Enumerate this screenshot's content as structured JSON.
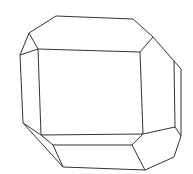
{
  "figure": {
    "background": "#ffffff",
    "stroke": "#333333",
    "vertices": {
      "A": [
        56,
        16
      ],
      "B": [
        133,
        19
      ],
      "C": [
        153,
        37
      ],
      "D": [
        174,
        61
      ],
      "E": [
        181,
        69
      ],
      "F": [
        181,
        136
      ],
      "G": [
        174,
        157
      ],
      "H": [
        145,
        170
      ],
      "I": [
        63,
        167
      ],
      "J": [
        23,
        123
      ],
      "K": [
        20,
        55
      ],
      "L": [
        29,
        33
      ],
      "P": [
        38,
        49
      ],
      "Q": [
        140,
        52
      ],
      "R": [
        143,
        134
      ],
      "S": [
        41,
        135
      ],
      "T": [
        132,
        145
      ],
      "U": [
        53,
        145
      ],
      "V": [
        175,
        127
      ]
    },
    "edges": [
      [
        "A",
        "B"
      ],
      [
        "B",
        "C"
      ],
      [
        "C",
        "D"
      ],
      [
        "D",
        "E"
      ],
      [
        "E",
        "F"
      ],
      [
        "F",
        "G"
      ],
      [
        "G",
        "H"
      ],
      [
        "H",
        "I"
      ],
      [
        "I",
        "J"
      ],
      [
        "J",
        "K"
      ],
      [
        "K",
        "L"
      ],
      [
        "L",
        "A"
      ],
      [
        "P",
        "Q"
      ],
      [
        "Q",
        "R"
      ],
      [
        "R",
        "S"
      ],
      [
        "S",
        "P"
      ],
      [
        "L",
        "P"
      ],
      [
        "C",
        "Q"
      ],
      [
        "K",
        "P"
      ],
      [
        "R",
        "T"
      ],
      [
        "T",
        "U"
      ],
      [
        "U",
        "S"
      ],
      [
        "T",
        "H"
      ],
      [
        "U",
        "I"
      ],
      [
        "S",
        "J"
      ],
      [
        "R",
        "V"
      ],
      [
        "V",
        "F"
      ],
      [
        "D",
        "V"
      ]
    ]
  }
}
